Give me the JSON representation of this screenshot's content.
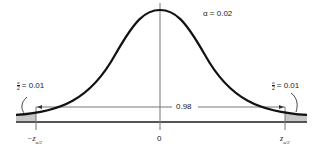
{
  "diagram": {
    "type": "normal-distribution-two-tailed",
    "alpha_label": "α = 0.02",
    "center_tick": "0",
    "left_critical": "−z",
    "left_critical_sub": "α/2",
    "right_critical": "z",
    "right_critical_sub": "α/2",
    "middle_area": "0.98",
    "left_tail": {
      "frac_num": "α",
      "frac_den": "2",
      "value": "= 0.01"
    },
    "right_tail": {
      "frac_num": "α",
      "frac_den": "2",
      "value": "= 0.01"
    },
    "colors": {
      "curve": "#111111",
      "axis": "#555555",
      "shade": "#c8c8c8",
      "line": "#777777"
    }
  }
}
